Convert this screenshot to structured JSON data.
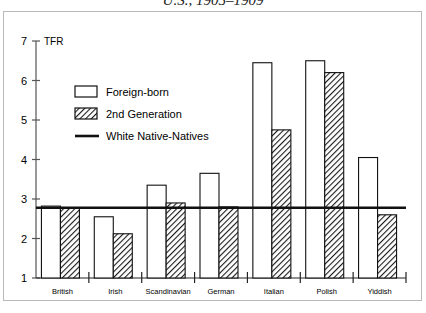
{
  "title": "U.S., 1905–1909",
  "axis": {
    "y_name": "TFR",
    "y_ticks": [
      "1",
      "2",
      "3",
      "4",
      "5",
      "6",
      "7"
    ],
    "y_min": 1,
    "y_max": 7
  },
  "legend": {
    "items": [
      {
        "label": "Foreign-born",
        "swatch": "open-box-swatch"
      },
      {
        "label": "2nd Generation",
        "swatch": "hatched-box-swatch"
      },
      {
        "label": "White Native-Natives",
        "swatch": "solid-line-swatch"
      }
    ]
  },
  "chart_data": {
    "type": "bar",
    "title": "U.S., 1905–1909",
    "xlabel": "",
    "ylabel": "TFR",
    "ylim": [
      1,
      7
    ],
    "grid": false,
    "legend_position": "upper-left-inside",
    "categories": [
      "British",
      "Irish",
      "Scandinavian",
      "German",
      "Italian",
      "Polish",
      "Yiddish"
    ],
    "series": [
      {
        "name": "Foreign-born",
        "values": [
          2.82,
          2.55,
          3.35,
          3.65,
          6.45,
          6.5,
          4.05
        ]
      },
      {
        "name": "2nd Generation",
        "values": [
          2.78,
          2.12,
          2.9,
          2.8,
          4.75,
          6.2,
          2.6
        ]
      }
    ],
    "reference_line": {
      "name": "White Native-Natives",
      "value": 2.78
    }
  }
}
